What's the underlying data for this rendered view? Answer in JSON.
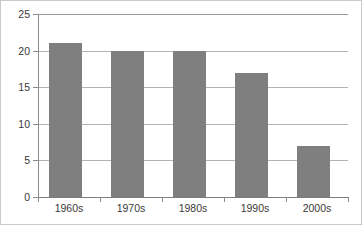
{
  "chart_data": {
    "type": "bar",
    "title": "",
    "subtitle": "",
    "xlabel": "",
    "ylabel": "",
    "categories": [
      "1960s",
      "1970s",
      "1980s",
      "1990s",
      "2000s"
    ],
    "values": [
      21,
      20,
      20,
      17,
      7
    ],
    "ylim": [
      0,
      25
    ],
    "yticks": [
      0,
      5,
      10,
      15,
      20,
      25
    ],
    "ytick_labels": [
      "0",
      "5",
      "10",
      "15",
      "20",
      "25"
    ],
    "grid": true,
    "grid_axis": "y",
    "legend": false,
    "legend_position": "none",
    "bar_color": "#7f7f7f",
    "grid_color": "#b3b3b3",
    "axis_color": "#8c8c8c",
    "background_color": "#ffffff",
    "border_color": "#c9c9c9"
  }
}
